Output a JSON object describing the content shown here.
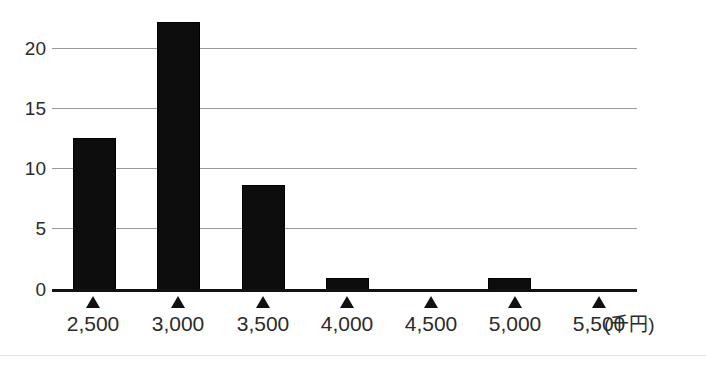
{
  "chart_data": {
    "type": "bar",
    "title": "",
    "subtitle": "",
    "xlabel": "(千円)",
    "ylabel": "",
    "categories": [
      "2,500",
      "3,000",
      "3,500",
      "4,000",
      "4,500",
      "5,000",
      "5,500"
    ],
    "values": [
      13,
      23,
      9,
      1,
      0,
      1,
      0
    ],
    "ylim": [
      0,
      24
    ],
    "yticks": [
      0,
      5,
      10,
      15,
      20
    ],
    "ytick_labels": [
      "0",
      "5",
      "10",
      "15",
      "20"
    ],
    "grid": true,
    "grid_axis": "y",
    "legend": null,
    "legend_position": "none",
    "bar_color": "#0d0d0d",
    "grid_color": "#9a9a9a",
    "axis_color": "#111111",
    "text_color": "#2b2b2b",
    "annotations": [],
    "x_marker_glyph": "▲",
    "unit_note": "(千円)"
  }
}
